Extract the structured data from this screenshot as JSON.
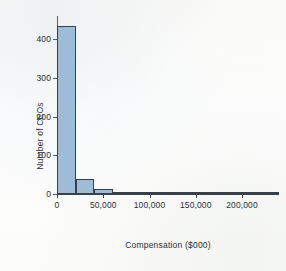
{
  "chart_data": {
    "type": "bar",
    "title": "",
    "xlabel": "Compensation ($000)",
    "ylabel": "Number of CEOs",
    "xlim": [
      0,
      240000
    ],
    "ylim": [
      0,
      460
    ],
    "grid": false,
    "legend": "none",
    "bin_width": 20000,
    "xtick_labels": [
      "0",
      "50,000",
      "100,000",
      "150,000",
      "200,000"
    ],
    "xtick_values": [
      0,
      50000,
      100000,
      150000,
      200000
    ],
    "ytick_labels": [
      "0",
      "100",
      "200",
      "300",
      "400"
    ],
    "ytick_values": [
      0,
      100,
      200,
      300,
      400
    ],
    "bin_starts": [
      0,
      20000,
      40000,
      60000,
      80000,
      100000,
      120000,
      140000,
      160000,
      180000,
      200000,
      220000
    ],
    "values": [
      435,
      40,
      13,
      3,
      2,
      0,
      1,
      1,
      0,
      0,
      0,
      2
    ],
    "bar_color": "#9dbcd8",
    "bar_edge_color": "#3a4046",
    "axis_color": "#3c4145"
  }
}
